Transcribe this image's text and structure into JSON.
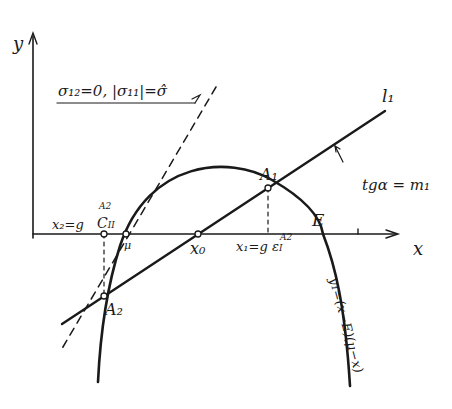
{
  "diagram": {
    "axes": {
      "x_label": "x",
      "y_label": "y"
    },
    "condition_label": "σ₁₂=0, |σ₁₁|=σ̂",
    "line_label": "l₁",
    "slope_label": "tgα = m₁",
    "points": {
      "A1": "A₁",
      "A2": "A₂",
      "E": "E",
      "x0": "x₀",
      "mu": "μ",
      "C2": "C",
      "C2_sub": "II",
      "C2_sup": "A2"
    },
    "x1_label": "x₁=g",
    "x1_eps": "ε",
    "x1_eps_sub": "I",
    "x1_eps_sup": "A2",
    "x2_label": "x₂=g",
    "curve_label": "y₁=(x−E)(μ−x)"
  }
}
